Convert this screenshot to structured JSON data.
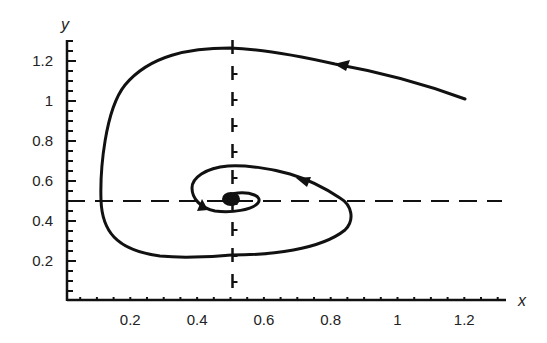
{
  "chart_data": {
    "type": "line",
    "title": "",
    "xlabel": "x",
    "ylabel": "y",
    "xlim": [
      0,
      1.3
    ],
    "ylim": [
      0,
      1.3
    ],
    "x_ticks": [
      "0.2",
      "0.4",
      "0.6",
      "0.8",
      "1",
      "1.2"
    ],
    "y_ticks": [
      "0.2",
      "0.4",
      "0.6",
      "0.8",
      "1",
      "1.2"
    ],
    "grid": false,
    "legend": null,
    "reference_lines": [
      {
        "orientation": "vertical",
        "x": 0.5,
        "style": "dashed"
      },
      {
        "orientation": "horizontal",
        "y": 0.5,
        "style": "dashed"
      }
    ],
    "equilibrium_point": {
      "x": 0.5,
      "y": 0.5
    },
    "series": [
      {
        "name": "trajectory",
        "description": "spiral trajectory converging to equilibrium (0.5, 0.5), counterclockwise",
        "points": [
          [
            1.2,
            1.0
          ],
          [
            1.0,
            1.1
          ],
          [
            0.82,
            1.18
          ],
          [
            0.65,
            1.23
          ],
          [
            0.5,
            1.26
          ],
          [
            0.35,
            1.22
          ],
          [
            0.22,
            1.08
          ],
          [
            0.15,
            0.85
          ],
          [
            0.13,
            0.6
          ],
          [
            0.14,
            0.38
          ],
          [
            0.25,
            0.27
          ],
          [
            0.5,
            0.23
          ],
          [
            0.7,
            0.28
          ],
          [
            0.84,
            0.38
          ],
          [
            0.82,
            0.5
          ],
          [
            0.7,
            0.6
          ],
          [
            0.5,
            0.67
          ],
          [
            0.42,
            0.62
          ],
          [
            0.38,
            0.53
          ],
          [
            0.42,
            0.46
          ],
          [
            0.5,
            0.44
          ],
          [
            0.58,
            0.48
          ],
          [
            0.55,
            0.53
          ],
          [
            0.5,
            0.52
          ],
          [
            0.5,
            0.5
          ]
        ]
      }
    ],
    "annotations": [
      "direction arrows along trajectory"
    ]
  }
}
